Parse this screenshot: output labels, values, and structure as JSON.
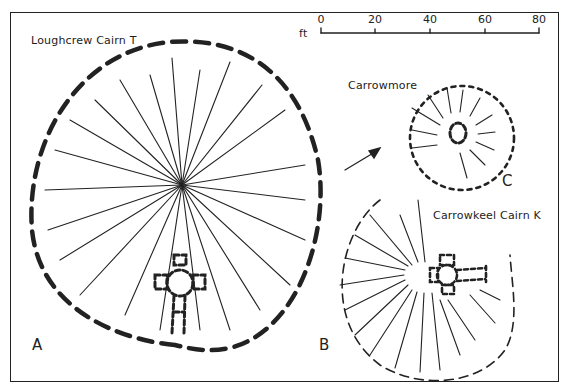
{
  "figure": {
    "labels": {
      "loughcrew": "Loughcrew Cairn T",
      "carrowmore": "Carrowmore",
      "carrowkeel": "Carrowkeel Cairn K"
    },
    "panel_letters": {
      "a": "A",
      "b": "B",
      "c": "C"
    },
    "scale_bar": {
      "unit": "ft",
      "ticks": [
        "0",
        "20",
        "40",
        "60",
        "80"
      ]
    }
  },
  "colors": {
    "ink": "#222222",
    "background": "#ffffff"
  }
}
